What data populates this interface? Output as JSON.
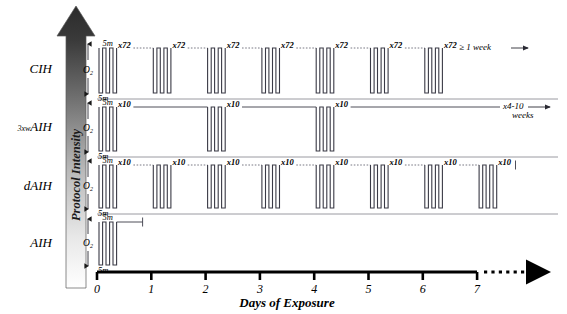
{
  "figure": {
    "kind": "protocol-timeline-diagram",
    "intensity_axis": {
      "label": "Protocol Intensity",
      "direction": "upward",
      "gradient_from": "#ffffff",
      "gradient_to": "#2b2b2b"
    },
    "x_axis": {
      "title": "Days of Exposure",
      "ticks": [
        "0",
        "1",
        "2",
        "3",
        "4",
        "5",
        "6",
        "7"
      ],
      "continues_dotted": true
    },
    "o2_axis_label": "O",
    "o2_axis_subscript": "2",
    "duration_top": "5m",
    "duration_bottom": "5m",
    "rows": [
      {
        "id": "cih",
        "label": "CIH",
        "label_prefix": "",
        "burst_days": [
          0,
          1,
          2,
          3,
          4,
          5,
          6
        ],
        "repeat_label": "x72",
        "connector_style": "dotted",
        "end_label": "≥ 1 week",
        "end_arrow": true
      },
      {
        "id": "3xwaih",
        "label": "AIH",
        "label_prefix": "3xw",
        "burst_days": [
          0,
          2,
          4
        ],
        "repeat_label": "x10",
        "connector_style": "solid",
        "end_label": "x4-10",
        "end_label_line2": "weeks",
        "end_arrow": true
      },
      {
        "id": "daih",
        "label": "dAIH",
        "label_prefix": "",
        "burst_days": [
          0,
          1,
          2,
          3,
          4,
          5,
          6,
          7
        ],
        "repeat_label": "x10",
        "connector_style": "dotted",
        "end_label": "",
        "end_arrow": false
      },
      {
        "id": "aih",
        "label": "AIH",
        "label_prefix": "",
        "burst_days": [
          0
        ],
        "repeat_label": "",
        "connector_style": "none",
        "end_label": "",
        "end_arrow": false
      }
    ]
  }
}
